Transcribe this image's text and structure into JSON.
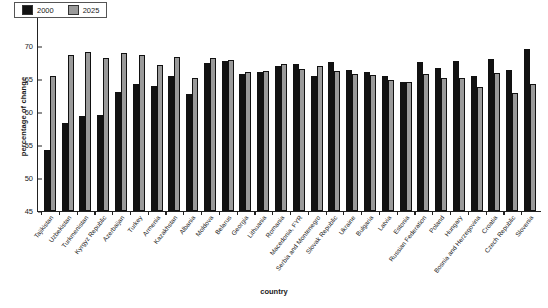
{
  "chart_data": {
    "type": "bar",
    "title": "",
    "xlabel": "country",
    "ylabel": "percentage of change",
    "ylim": [
      45,
      75
    ],
    "yticks": [
      45,
      50,
      55,
      60,
      65,
      70,
      75
    ],
    "grid": false,
    "legend_position": "top-left",
    "categories": [
      "Tajikistan",
      "Uzbekistan",
      "Turkmenistan",
      "Kyrgyz Republic",
      "Azerbaijan",
      "Turkey",
      "Armenia",
      "Kazakhstan",
      "Albania",
      "Moldova",
      "Belarus",
      "Georgia",
      "Lithuania",
      "Romania",
      "Macedonia, FYR",
      "Serbia and Montenegro",
      "Slovak Republic",
      "Ukraine",
      "Bulgaria",
      "Latvia",
      "Estonia",
      "Russian Federation",
      "Poland",
      "Hungary",
      "Bosnia and Herzegovina",
      "Croatia",
      "Czech Republic",
      "Slovenia"
    ],
    "series": [
      {
        "name": "2000",
        "color": "#121212",
        "values": [
          54.3,
          58.4,
          59.4,
          59.5,
          63.1,
          64.2,
          64.0,
          65.4,
          62.7,
          67.5,
          67.7,
          65.8,
          66.0,
          67.0,
          67.2,
          65.5,
          67.6,
          66.4,
          66.0,
          65.4,
          64.6,
          67.6,
          66.7,
          67.8,
          65.4,
          68.0,
          66.4,
          69.6
        ],
        "unit": "%"
      },
      {
        "name": "2025",
        "color": "#9a9a9a",
        "values": [
          65.4,
          68.7,
          69.1,
          68.2,
          68.9,
          68.7,
          67.1,
          68.3,
          65.1,
          68.2,
          67.9,
          66.1,
          66.2,
          67.3,
          66.5,
          66.9,
          66.2,
          65.8,
          65.6,
          64.9,
          64.5,
          65.7,
          65.2,
          65.1,
          63.8,
          65.9,
          62.9,
          64.2
        ],
        "unit": "%"
      }
    ]
  },
  "legend": {
    "items": [
      {
        "label": "2000",
        "color": "#121212"
      },
      {
        "label": "2025",
        "color": "#9a9a9a"
      }
    ]
  }
}
